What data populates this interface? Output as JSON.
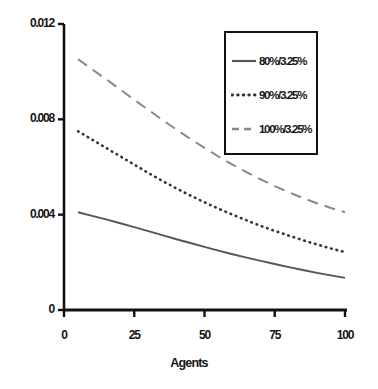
{
  "chart_data": {
    "type": "line",
    "title": "",
    "subtitle": "",
    "xlabel": "Agents",
    "ylabel": "",
    "xlim": [
      0,
      100
    ],
    "ylim": [
      0,
      0.012
    ],
    "grid": false,
    "legend_position": "top-right",
    "x_ticks": [
      "0",
      "25",
      "50",
      "75",
      "100"
    ],
    "x_tick_values": [
      0,
      25,
      50,
      75,
      100
    ],
    "y_ticks": [
      "0",
      "0.004",
      "0.008",
      "0.012"
    ],
    "y_tick_values": [
      0,
      0.004,
      0.008,
      0.012
    ],
    "x": [
      5,
      10,
      15,
      20,
      25,
      30,
      35,
      40,
      45,
      50,
      55,
      60,
      65,
      70,
      75,
      80,
      85,
      90,
      95,
      100
    ],
    "series": [
      {
        "name": "80%/3.25%",
        "style": "solid",
        "color": "#555555",
        "values": [
          0.0041,
          0.00395,
          0.0038,
          0.00364,
          0.00348,
          0.00331,
          0.00314,
          0.00297,
          0.00281,
          0.00265,
          0.00249,
          0.00234,
          0.0022,
          0.00206,
          0.00193,
          0.0018,
          0.00168,
          0.00156,
          0.00145,
          0.00135
        ]
      },
      {
        "name": "90%/3.25%",
        "style": "dotted",
        "color": "#333333",
        "values": [
          0.0075,
          0.00715,
          0.0068,
          0.00645,
          0.0061,
          0.00575,
          0.00542,
          0.0051,
          0.0048,
          0.00452,
          0.00425,
          0.004,
          0.00376,
          0.00353,
          0.00332,
          0.00312,
          0.00293,
          0.00275,
          0.00258,
          0.00243
        ]
      },
      {
        "name": "100%/3.25%",
        "style": "dashed",
        "color": "#888888",
        "values": [
          0.01052,
          0.0101,
          0.00968,
          0.00925,
          0.00882,
          0.0084,
          0.00798,
          0.00757,
          0.00718,
          0.0068,
          0.00644,
          0.0061,
          0.00578,
          0.00548,
          0.0052,
          0.00494,
          0.0047,
          0.00448,
          0.00428,
          0.0041
        ]
      }
    ]
  },
  "axes": {
    "axis_color": "#111111"
  },
  "legend": {
    "entries": [
      {
        "label": "80%/3.25%",
        "style": "solid"
      },
      {
        "label": "90%/3.25%",
        "style": "dotted"
      },
      {
        "label": "100%/3.25%",
        "style": "dashed"
      }
    ]
  }
}
